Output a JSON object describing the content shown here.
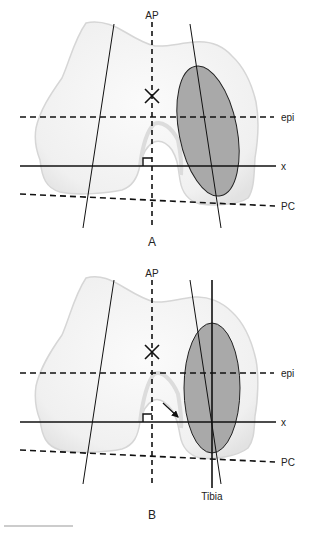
{
  "figure": {
    "panels": [
      {
        "id": "A",
        "caption": "A",
        "labels": {
          "ap": "AP",
          "epi": "epi",
          "x": "x",
          "pc": "PC"
        },
        "markers": {
          "center_cross": "X",
          "right_angle": true
        }
      },
      {
        "id": "B",
        "caption": "B",
        "labels": {
          "ap": "AP",
          "epi": "epi",
          "x": "x",
          "pc": "PC",
          "tibia": "Tibia"
        },
        "markers": {
          "center_cross": "X",
          "right_angle": true,
          "arrow": true
        }
      }
    ],
    "colors": {
      "bone_fill": "#f2f2f2",
      "bone_edge": "#d8d8d8",
      "ellipse_fill": "#a9a9a9",
      "line": "#111111"
    }
  }
}
